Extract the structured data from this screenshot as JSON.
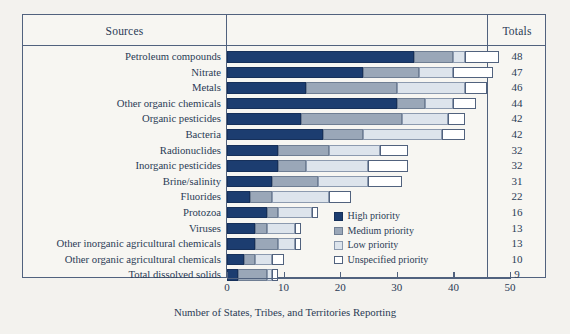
{
  "table": {
    "sources_header": "Sources",
    "totals_header": "Totals"
  },
  "legend": {
    "position": "inside-bottom-right",
    "items": [
      {
        "label": "High priority",
        "swatch": "high",
        "color": "#1c3d70"
      },
      {
        "label": "Medium priority",
        "swatch": "med",
        "color": "#9aa7b8"
      },
      {
        "label": "Low priority",
        "swatch": "low",
        "color": "#dde4ec"
      },
      {
        "label": "Unspecified priority",
        "swatch": "uns",
        "color": "#ffffff"
      }
    ]
  },
  "chart_data": {
    "type": "bar",
    "orientation": "horizontal",
    "stacked": true,
    "title": "",
    "xlabel": "Number of States, Tribes, and Territories Reporting",
    "ylabel": "Sources",
    "xlim": [
      0,
      50
    ],
    "xticks": [
      0,
      10,
      20,
      30,
      40,
      50
    ],
    "xticklabels": [
      "0",
      "10",
      "20",
      "30",
      "40",
      "50"
    ],
    "grid": false,
    "categories": [
      "Petroleum compounds",
      "Nitrate",
      "Metals",
      "Other organic chemicals",
      "Organic pesticides",
      "Bacteria",
      "Radionuclides",
      "Inorganic pesticides",
      "Brine/salinity",
      "Fluorides",
      "Protozoa",
      "Viruses",
      "Other inorganic agricultural chemicals",
      "Other organic agricultural chemicals",
      "Total dissolved solids"
    ],
    "series": [
      {
        "name": "High priority",
        "values": [
          33,
          24,
          14,
          30,
          13,
          17,
          9,
          9,
          8,
          4,
          7,
          5,
          5,
          3,
          2
        ]
      },
      {
        "name": "Medium priority",
        "values": [
          7,
          10,
          16,
          5,
          18,
          7,
          9,
          5,
          8,
          4,
          2,
          2,
          4,
          2,
          5
        ]
      },
      {
        "name": "Low priority",
        "values": [
          2,
          6,
          12,
          5,
          8,
          14,
          9,
          11,
          9,
          10,
          6,
          5,
          3,
          3,
          1
        ]
      },
      {
        "name": "Unspecified priority",
        "values": [
          6,
          7,
          4,
          4,
          3,
          4,
          5,
          7,
          6,
          4,
          1,
          1,
          1,
          2,
          1
        ]
      }
    ],
    "totals": [
      48,
      47,
      46,
      44,
      42,
      42,
      32,
      32,
      31,
      22,
      16,
      13,
      13,
      10,
      9
    ],
    "rows": [
      {
        "label": "Petroleum compounds",
        "high": 33,
        "medium": 7,
        "low": 2,
        "unspecified": 6,
        "total": 48
      },
      {
        "label": "Nitrate",
        "high": 24,
        "medium": 10,
        "low": 6,
        "unspecified": 7,
        "total": 47
      },
      {
        "label": "Metals",
        "high": 14,
        "medium": 16,
        "low": 12,
        "unspecified": 4,
        "total": 46
      },
      {
        "label": "Other organic chemicals",
        "high": 30,
        "medium": 5,
        "low": 5,
        "unspecified": 4,
        "total": 44
      },
      {
        "label": "Organic pesticides",
        "high": 13,
        "medium": 18,
        "low": 8,
        "unspecified": 3,
        "total": 42
      },
      {
        "label": "Bacteria",
        "high": 17,
        "medium": 7,
        "low": 14,
        "unspecified": 4,
        "total": 42
      },
      {
        "label": "Radionuclides",
        "high": 9,
        "medium": 9,
        "low": 9,
        "unspecified": 5,
        "total": 32
      },
      {
        "label": "Inorganic pesticides",
        "high": 9,
        "medium": 5,
        "low": 11,
        "unspecified": 7,
        "total": 32
      },
      {
        "label": "Brine/salinity",
        "high": 8,
        "medium": 8,
        "low": 9,
        "unspecified": 6,
        "total": 31
      },
      {
        "label": "Fluorides",
        "high": 4,
        "medium": 4,
        "low": 10,
        "unspecified": 4,
        "total": 22
      },
      {
        "label": "Protozoa",
        "high": 7,
        "medium": 2,
        "low": 6,
        "unspecified": 1,
        "total": 16
      },
      {
        "label": "Viruses",
        "high": 5,
        "medium": 2,
        "low": 5,
        "unspecified": 1,
        "total": 13
      },
      {
        "label": "Other inorganic agricultural chemicals",
        "high": 5,
        "medium": 4,
        "low": 3,
        "unspecified": 1,
        "total": 13
      },
      {
        "label": "Other organic agricultural chemicals",
        "high": 3,
        "medium": 2,
        "low": 3,
        "unspecified": 2,
        "total": 10
      },
      {
        "label": "Total dissolved solids",
        "high": 2,
        "medium": 5,
        "low": 1,
        "unspecified": 1,
        "total": 9
      }
    ]
  }
}
